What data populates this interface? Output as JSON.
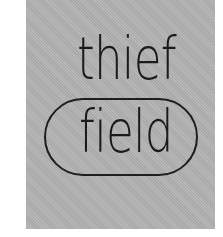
{
  "panel": {
    "background_color": "#b2b2b2"
  },
  "words": {
    "top": "thief",
    "bottom": "field"
  },
  "pill": {
    "border_color": "#1e1e1e"
  }
}
